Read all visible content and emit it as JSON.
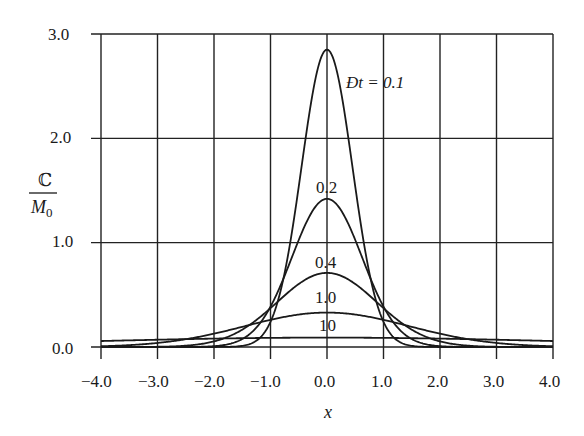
{
  "chart_data": {
    "type": "line",
    "title": "",
    "xlabel": "x",
    "ylabel_numerator": "ℂ",
    "ylabel_denominator": "M",
    "ylabel_denominator_sub": "0",
    "xlim": [
      -4.0,
      4.0
    ],
    "ylim": [
      0.0,
      3.0
    ],
    "grid": true,
    "x_ticks": [
      -4.0,
      -3.0,
      -2.0,
      -1.0,
      0.0,
      1.0,
      2.0,
      3.0,
      4.0
    ],
    "x_tick_labels": [
      "−4.0",
      "−3.0",
      "−2.0",
      "−1.0",
      "0.0",
      "1.0",
      "2.0",
      "3.0",
      "4.0"
    ],
    "y_ticks": [
      0.0,
      1.0,
      2.0,
      3.0
    ],
    "y_tick_labels": [
      "0.0",
      "1.0",
      "2.0",
      "3.0"
    ],
    "series": [
      {
        "name": "Ðt = 0.1",
        "label": "Ðt = 0.1",
        "peak": 2.85,
        "sigma": 0.45
      },
      {
        "name": "0.2",
        "label": "0.2",
        "peak": 1.42,
        "sigma": 0.62
      },
      {
        "name": "0.4",
        "label": "0.4",
        "peak": 0.71,
        "sigma": 0.88
      },
      {
        "name": "1.0",
        "label": "1.0",
        "peak": 0.33,
        "sigma": 1.45
      },
      {
        "name": "10",
        "label": "10",
        "peak": 0.09,
        "sigma": 4.2
      }
    ],
    "x": [
      -4.0,
      -3.0,
      -2.0,
      -1.5,
      -1.0,
      -0.5,
      0.0,
      0.5,
      1.0,
      1.5,
      2.0,
      3.0,
      4.0
    ],
    "values_by_series": {
      "0.1": [
        0.0,
        0.0,
        0.0,
        0.01,
        0.24,
        1.54,
        2.85,
        1.54,
        0.24,
        0.01,
        0.0,
        0.0,
        0.0
      ],
      "0.2": [
        0.0,
        0.0,
        0.01,
        0.08,
        0.39,
        1.02,
        1.42,
        1.02,
        0.39,
        0.08,
        0.01,
        0.0,
        0.0
      ],
      "0.4": [
        0.0,
        0.0,
        0.05,
        0.17,
        0.37,
        0.6,
        0.71,
        0.6,
        0.37,
        0.17,
        0.05,
        0.0,
        0.0
      ],
      "1.0": [
        0.01,
        0.04,
        0.13,
        0.19,
        0.26,
        0.31,
        0.33,
        0.31,
        0.26,
        0.19,
        0.13,
        0.04,
        0.01
      ],
      "10": [
        0.06,
        0.07,
        0.08,
        0.085,
        0.088,
        0.089,
        0.09,
        0.089,
        0.088,
        0.085,
        0.08,
        0.07,
        0.06
      ]
    }
  },
  "labels": {
    "curve_01": "Ðt = 0.1",
    "curve_02": "0.2",
    "curve_04": "0.4",
    "curve_10": "1.0",
    "curve_100": "10",
    "x_axis_title": "x",
    "y_num": "ℂ",
    "y_den": "M",
    "y_den_sub": "0",
    "yt0": "0.0",
    "yt1": "1.0",
    "yt2": "2.0",
    "yt3": "3.0",
    "xt0": "−4.0",
    "xt1": "−3.0",
    "xt2": "−2.0",
    "xt3": "−1.0",
    "xt4": "0.0",
    "xt5": "1.0",
    "xt6": "2.0",
    "xt7": "3.0",
    "xt8": "4.0"
  }
}
